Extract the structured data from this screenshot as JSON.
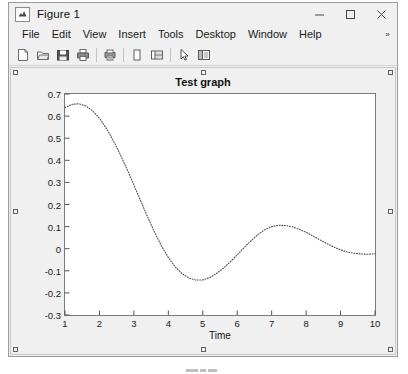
{
  "window": {
    "title": "Figure 1",
    "app_icon": "matlab-figure-icon",
    "controls": [
      {
        "name": "minimize-button",
        "glyph": "minimize-icon"
      },
      {
        "name": "maximize-button",
        "glyph": "maximize-icon"
      },
      {
        "name": "close-button",
        "glyph": "close-icon"
      }
    ]
  },
  "menu": {
    "items": [
      {
        "label": "File"
      },
      {
        "label": "Edit"
      },
      {
        "label": "View"
      },
      {
        "label": "Insert"
      },
      {
        "label": "Tools"
      },
      {
        "label": "Desktop"
      },
      {
        "label": "Window"
      },
      {
        "label": "Help"
      }
    ],
    "overflow_glyph": "»"
  },
  "toolbar": {
    "buttons": [
      {
        "name": "new-figure-button",
        "icon": "new-document-icon",
        "tooltip": "New Figure"
      },
      {
        "name": "open-file-button",
        "icon": "open-folder-icon",
        "tooltip": "Open File"
      },
      {
        "name": "save-figure-button",
        "icon": "save-floppy-icon",
        "tooltip": "Save Figure"
      },
      {
        "name": "print-figure-button",
        "icon": "print-icon",
        "tooltip": "Print Figure"
      },
      {
        "name": "print-preview-button",
        "icon": "print-preview-icon",
        "tooltip": "Print Preview"
      },
      {
        "name": "insert-legend-button",
        "icon": "legend-icon",
        "tooltip": "Insert Legend"
      },
      {
        "name": "insert-colorbar-button",
        "icon": "colorbar-icon",
        "tooltip": "Insert Colorbar"
      },
      {
        "name": "edit-plot-button",
        "icon": "arrow-pointer-icon",
        "tooltip": "Edit Plot"
      },
      {
        "name": "show-plot-tools-button",
        "icon": "plot-tools-icon",
        "tooltip": "Show Plot Tools"
      }
    ]
  },
  "chart_data": {
    "type": "line",
    "title": "Test graph",
    "xlabel": "Time",
    "ylabel": "",
    "xlim": [
      1,
      10
    ],
    "ylim": [
      -0.3,
      0.7
    ],
    "xticks": [
      1,
      2,
      3,
      4,
      5,
      6,
      7,
      8,
      9,
      10
    ],
    "yticks": [
      -0.3,
      -0.2,
      -0.1,
      0,
      0.1,
      0.2,
      0.3,
      0.4,
      0.5,
      0.6,
      0.7
    ],
    "grid": false,
    "legend": null,
    "line_style": "dotted",
    "line_color": "#4d4d4d",
    "series": [
      {
        "name": "damped oscillation",
        "x": [
          1.0,
          1.2,
          1.4,
          1.6,
          1.8,
          2.0,
          2.2,
          2.4,
          2.6,
          2.8,
          3.0,
          3.2,
          3.4,
          3.6,
          3.8,
          4.0,
          4.2,
          4.4,
          4.6,
          4.8,
          5.0,
          5.2,
          5.4,
          5.6,
          5.8,
          6.0,
          6.2,
          6.4,
          6.6,
          6.8,
          7.0,
          7.2,
          7.4,
          7.6,
          7.8,
          8.0,
          8.2,
          8.4,
          8.6,
          8.8,
          9.0,
          9.2,
          9.4,
          9.6,
          9.8,
          10.0
        ],
        "y": [
          0.638,
          0.653,
          0.656,
          0.646,
          0.624,
          0.59,
          0.545,
          0.49,
          0.428,
          0.36,
          0.288,
          0.215,
          0.143,
          0.075,
          0.013,
          -0.04,
          -0.082,
          -0.113,
          -0.133,
          -0.142,
          -0.141,
          -0.131,
          -0.112,
          -0.088,
          -0.059,
          -0.028,
          0.005,
          0.036,
          0.064,
          0.086,
          0.1,
          0.106,
          0.105,
          0.099,
          0.088,
          0.074,
          0.057,
          0.04,
          0.023,
          0.008,
          -0.005,
          -0.015,
          -0.021,
          -0.024,
          -0.025,
          -0.023
        ]
      }
    ]
  },
  "figure_canvas": {
    "selection_handles": 8
  }
}
